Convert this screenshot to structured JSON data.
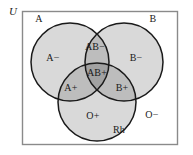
{
  "diagram": {
    "universe_label": "U",
    "sets": [
      {
        "id": "A",
        "label": "A",
        "cx": 70,
        "cy": 62,
        "r": 39
      },
      {
        "id": "B",
        "label": "B",
        "cx": 124,
        "cy": 62,
        "r": 39
      },
      {
        "id": "Rh",
        "label": "Rh",
        "cx": 97,
        "cy": 102,
        "r": 39
      }
    ],
    "set_labels": [
      {
        "name": "set-label-a",
        "text": "A",
        "x": 39,
        "y": 19
      },
      {
        "name": "set-label-b",
        "text": "B",
        "x": 153,
        "y": 19
      },
      {
        "name": "set-label-rh",
        "text": "Rh",
        "x": 119,
        "y": 130
      }
    ],
    "region_labels": [
      {
        "name": "region-a-minus",
        "text": "A−",
        "x": 53,
        "y": 58
      },
      {
        "name": "region-ab-minus",
        "text": "AB−",
        "x": 95,
        "y": 47
      },
      {
        "name": "region-b-minus",
        "text": "B−",
        "x": 136,
        "y": 58
      },
      {
        "name": "region-ab-plus",
        "text": "AB+",
        "x": 97,
        "y": 73
      },
      {
        "name": "region-a-plus",
        "text": "A+",
        "x": 71,
        "y": 88
      },
      {
        "name": "region-b-plus",
        "text": "B+",
        "x": 122,
        "y": 88
      },
      {
        "name": "region-o-plus",
        "text": "O+",
        "x": 93,
        "y": 116
      },
      {
        "name": "region-o-minus",
        "text": "O−",
        "x": 152,
        "y": 115
      }
    ],
    "universe": {
      "x": 22,
      "y": 11,
      "width": 156,
      "height": 134,
      "label_x": 13,
      "label_y": 10
    },
    "colors": {
      "background": "#ffffff",
      "single_fill": "#d9d9d9",
      "double_fill": "#bdbdbd",
      "triple_fill": "#a2a2a2",
      "stroke": "#1a1a1a",
      "frame_stroke": "#8a8a8a",
      "text": "#1a1a1a"
    }
  }
}
